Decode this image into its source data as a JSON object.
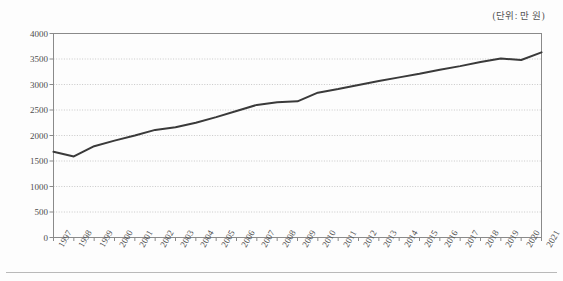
{
  "unit_label": "(단위: 만 원)",
  "colors": {
    "line": "#3a3a3a",
    "gridline": "#c8c8c8",
    "frame": "#8a8a8a",
    "text": "#4d4d4d",
    "background": "#fdfdfd",
    "rule": "#b9b9b9"
  },
  "chart_data": {
    "type": "line",
    "title": "",
    "subtitle": "",
    "xlabel": "",
    "ylabel": "",
    "annotations": [
      "(단위: 만 원)"
    ],
    "legend": [],
    "legend_position": "none",
    "grid": true,
    "grid_style": "dotted-horizontal",
    "xlim": [
      1997,
      2021
    ],
    "ylim": [
      0,
      4000
    ],
    "ytick_interval": 500,
    "yticks": [
      0,
      500,
      1000,
      1500,
      2000,
      2500,
      3000,
      3500,
      4000
    ],
    "ytick_labels": [
      "0",
      "500",
      "1000",
      "1500",
      "2000",
      "2500",
      "3000",
      "3500",
      "4000"
    ],
    "categories": [
      "1997",
      "1998",
      "1999",
      "2000",
      "2001",
      "2002",
      "2003",
      "2004",
      "2005",
      "2006",
      "2007",
      "2008",
      "2009",
      "2010",
      "2011",
      "2012",
      "2013",
      "2014",
      "2015",
      "2016",
      "2017",
      "2018",
      "2019",
      "2020",
      "2021"
    ],
    "x": [
      1997,
      1998,
      1999,
      2000,
      2001,
      2002,
      2003,
      2004,
      2005,
      2006,
      2007,
      2008,
      2009,
      2010,
      2011,
      2012,
      2013,
      2014,
      2015,
      2016,
      2017,
      2018,
      2019,
      2020,
      2021
    ],
    "series": [
      {
        "name": "가구 소득",
        "values": [
          1680,
          1590,
          1790,
          1900,
          2000,
          2110,
          2160,
          2250,
          2360,
          2480,
          2600,
          2650,
          2670,
          2840,
          2910,
          2990,
          3070,
          3140,
          3210,
          3290,
          3360,
          3440,
          3510,
          3480,
          3630
        ],
        "marker": "none",
        "line_width": 2,
        "color": "#3a3a3a"
      }
    ]
  }
}
